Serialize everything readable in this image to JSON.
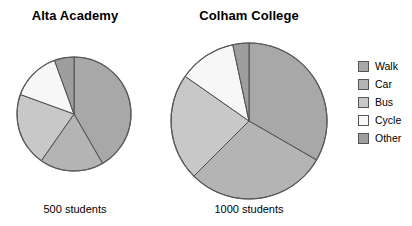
{
  "charts": {
    "alta": {
      "title": "Alta Academy",
      "caption": "500 students"
    },
    "colham": {
      "title": "Colham College",
      "caption": "1000 students"
    }
  },
  "legend": {
    "items": [
      {
        "label": "Walk",
        "color": "#a8a8a8"
      },
      {
        "label": "Car",
        "color": "#b4b4b4"
      },
      {
        "label": "Bus",
        "color": "#c8c8c8"
      },
      {
        "label": "Cycle",
        "color": "#f7f7f7"
      },
      {
        "label": "Other",
        "color": "#9e9e9e"
      }
    ]
  },
  "chart_data": [
    {
      "type": "pie",
      "title": "Alta Academy",
      "subtitle": "500 students",
      "total": 500,
      "total_label": "500 students",
      "categories": [
        "Walk",
        "Car",
        "Bus",
        "Cycle",
        "Other"
      ],
      "values": [
        41.7,
        18.1,
        20.8,
        13.9,
        5.5
      ],
      "units": "percent",
      "counts": [
        208,
        90,
        104,
        70,
        28
      ],
      "start_angle_deg": 0,
      "direction": "clockwise",
      "slice_end_angles_deg": [
        150,
        215,
        290,
        340,
        360
      ],
      "colors": [
        "#a8a8a8",
        "#b4b4b4",
        "#c8c8c8",
        "#f7f7f7",
        "#9e9e9e"
      ],
      "legend_position": "right",
      "grid": false,
      "radius_px": 57
    },
    {
      "type": "pie",
      "title": "Colham College",
      "subtitle": "1000 students",
      "total": 1000,
      "total_label": "1000 students",
      "categories": [
        "Walk",
        "Car",
        "Bus",
        "Cycle",
        "Other"
      ],
      "values": [
        33.3,
        29.2,
        22.2,
        11.9,
        3.3
      ],
      "units": "percent",
      "counts": [
        333,
        292,
        222,
        119,
        33
      ],
      "start_angle_deg": 0,
      "direction": "clockwise",
      "slice_end_angles_deg": [
        120,
        225,
        305,
        348,
        360
      ],
      "colors": [
        "#a8a8a8",
        "#b4b4b4",
        "#c8c8c8",
        "#f7f7f7",
        "#9e9e9e"
      ],
      "legend_position": "right",
      "grid": false,
      "radius_px": 78
    }
  ]
}
